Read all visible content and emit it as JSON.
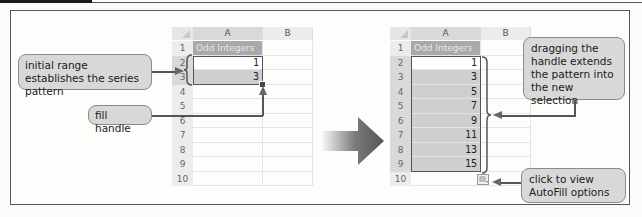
{
  "figure": {
    "accent_dark": "#555555",
    "callout_fill": "#d8d8d8",
    "header_fill": "#a9a9a9",
    "selection_fill": "#cfcfcf"
  },
  "left_sheet": {
    "columns": [
      "A",
      "B"
    ],
    "rows": [
      "1",
      "2",
      "3",
      "4",
      "5",
      "6",
      "7",
      "8",
      "9",
      "10"
    ],
    "header_cell": "Odd Integers",
    "values": [
      "1",
      "3"
    ]
  },
  "right_sheet": {
    "columns": [
      "A",
      "B"
    ],
    "rows": [
      "1",
      "2",
      "3",
      "4",
      "5",
      "6",
      "7",
      "8",
      "9",
      "10"
    ],
    "header_cell": "Odd Integers",
    "values": [
      "1",
      "3",
      "5",
      "7",
      "9",
      "11",
      "13",
      "15"
    ],
    "autofill_icon": "autofill-options-icon"
  },
  "callouts": {
    "initial_range": "initial range establishes the series pattern",
    "fill_handle": "fill handle",
    "dragging": "dragging the handle extends the pattern into the new selection",
    "autofill": "click to view AutoFill options"
  }
}
